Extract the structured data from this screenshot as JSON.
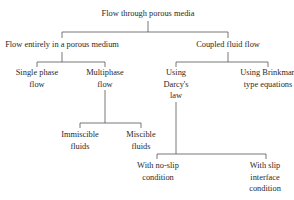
{
  "diagram": {
    "type": "tree",
    "root": {
      "id": "root",
      "lines": [
        "Flow through porous media"
      ],
      "children": [
        {
          "id": "porous",
          "lines": [
            "Flow entirely in a porous medium"
          ],
          "children": [
            {
              "id": "single",
              "lines": [
                "Single phase",
                "flow"
              ],
              "children": []
            },
            {
              "id": "multi",
              "lines": [
                "Multiphase",
                "flow"
              ],
              "children": [
                {
                  "id": "immiscible",
                  "lines": [
                    "Immiscible",
                    "fluids"
                  ],
                  "children": []
                },
                {
                  "id": "miscible",
                  "lines": [
                    "Miscible",
                    "fluids"
                  ],
                  "children": []
                }
              ]
            }
          ]
        },
        {
          "id": "coupled",
          "lines": [
            "Coupled fluid flow"
          ],
          "children": [
            {
              "id": "darcy",
              "lines": [
                "Using",
                "Darcy's",
                "law"
              ],
              "children": [
                {
                  "id": "noslip",
                  "lines": [
                    "With no-slip",
                    "condition"
                  ],
                  "children": []
                },
                {
                  "id": "slip",
                  "lines": [
                    "With slip",
                    "interface",
                    "condition"
                  ],
                  "children": []
                }
              ]
            },
            {
              "id": "brinkman",
              "lines": [
                "Using Brinkman",
                "type equations"
              ],
              "children": []
            }
          ]
        }
      ]
    }
  },
  "colors": {
    "text": "#2a2a2a",
    "line": "#555555",
    "background": "#ffffff"
  }
}
